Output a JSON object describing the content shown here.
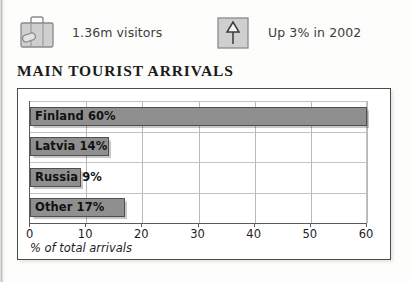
{
  "stats": [
    {
      "icon": "suitcase-icon",
      "label": "1.36m visitors"
    },
    {
      "icon": "up-arrow-icon",
      "label": "Up 3% in 2002"
    }
  ],
  "section_title": "MAIN TOURIST ARRIVALS",
  "colors": {
    "bar_fill": "#8f8f8f",
    "bar_border": "#4f4f4f",
    "frame_border": "#4a4a4a",
    "grid": "#b9b9b9",
    "text": "#111111"
  },
  "chart_data": {
    "type": "bar",
    "orientation": "horizontal",
    "title": "MAIN TOURIST ARRIVALS",
    "xlabel": "% of total arrivals",
    "ylabel": "",
    "categories": [
      "Finland",
      "Latvia",
      "Russia",
      "Other"
    ],
    "values": [
      60,
      14,
      9,
      17
    ],
    "value_labels": [
      "Finland 60%",
      "Latvia 14%",
      "Russia 9%",
      "Other 17%"
    ],
    "xlim": [
      0,
      60
    ],
    "xticks": [
      0,
      10,
      20,
      30,
      40,
      50,
      60
    ],
    "xtick_labels": [
      "0",
      "10",
      "20",
      "30",
      "40",
      "50",
      "60"
    ],
    "grid": true,
    "legend": false,
    "unit": "%"
  }
}
